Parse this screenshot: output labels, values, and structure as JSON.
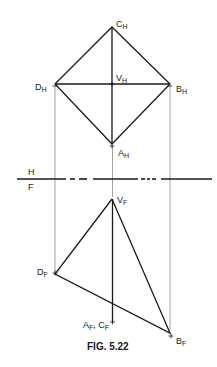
{
  "caption": "FIG. 5.22",
  "fold_line": {
    "upper_label": "H",
    "lower_label": "F"
  },
  "colors": {
    "line": "#1a1a1a",
    "projector": "#8a8a8a",
    "background": "#ffffff"
  },
  "top_view": {
    "points": {
      "C": {
        "main": "C",
        "sub": "H"
      },
      "D": {
        "main": "D",
        "sub": "H"
      },
      "V": {
        "main": "V",
        "sub": "H"
      },
      "B": {
        "main": "B",
        "sub": "H"
      },
      "A": {
        "main": "A",
        "sub": "H"
      }
    }
  },
  "front_view": {
    "points": {
      "V": {
        "main": "V",
        "sub": "F"
      },
      "D": {
        "main": "D",
        "sub": "F"
      },
      "AC": {
        "main1": "A",
        "sub1": "F",
        "sep": ", ",
        "main2": "C",
        "sub2": "F"
      },
      "B": {
        "main": "B",
        "sub": "F"
      }
    }
  }
}
